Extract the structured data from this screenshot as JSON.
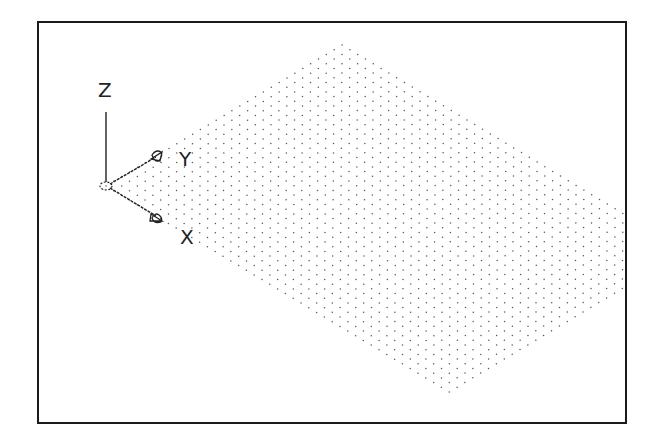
{
  "viewport": {
    "border_color": "#1a1a1a",
    "background": "#ffffff"
  },
  "ucs_icon": {
    "origin": [
      104,
      184
    ],
    "labels": {
      "z": "Z",
      "y": "Y",
      "x": "X"
    },
    "z_axis_top": [
      104,
      110
    ],
    "y_arrow_tip": [
      160,
      151
    ],
    "x_arrow_tip": [
      160,
      218
    ],
    "line_color": "#222222"
  },
  "grid": {
    "origin": [
      104,
      184
    ],
    "y_step": [
      7.87,
      -4.7
    ],
    "x_step": [
      7.8,
      4.68
    ],
    "y_count": 30,
    "x_count": 44,
    "dot_color": "#555555",
    "dot_radius": 0.75
  }
}
